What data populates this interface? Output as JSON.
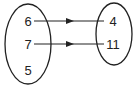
{
  "diagram": {
    "type": "mapping",
    "domain": {
      "label": "domain-set",
      "values": [
        "6",
        "7",
        "5"
      ]
    },
    "range": {
      "label": "range-set",
      "values": [
        "4",
        "11"
      ]
    },
    "mappings": [
      {
        "from": "6",
        "to": "4"
      },
      {
        "from": "7",
        "to": "11"
      }
    ],
    "colors": {
      "stroke": "#222222",
      "background": "#ffffff"
    }
  }
}
